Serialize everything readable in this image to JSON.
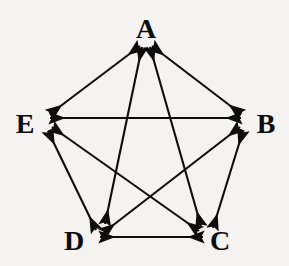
{
  "figure": {
    "background_color": "#f4f3f1",
    "stroke_color": "#0d0d0d",
    "label_color": "#0d0d0d",
    "width": 289,
    "height": 266
  },
  "chart_data": {
    "type": "diagram",
    "subtype": "node-link-graph",
    "title": "",
    "xlabel": "",
    "ylabel": "",
    "grid": false,
    "legend": null,
    "directed": true,
    "bidirectional": true,
    "node_count": 5,
    "edge_count": 10,
    "nodes": [
      {
        "id": "A",
        "label": "A",
        "label_x": 146,
        "label_y": 29,
        "port_x": 146,
        "port_y": 45
      },
      {
        "id": "B",
        "label": "B",
        "label_x": 266,
        "label_y": 124,
        "port_x": 243,
        "port_y": 122
      },
      {
        "id": "C",
        "label": "C",
        "label_x": 220,
        "label_y": 241,
        "port_x": 202,
        "port_y": 230
      },
      {
        "id": "D",
        "label": "D",
        "label_x": 74,
        "label_y": 241,
        "port_x": 100,
        "port_y": 230
      },
      {
        "id": "E",
        "label": "E",
        "label_x": 25,
        "label_y": 124,
        "port_x": 48,
        "port_y": 122
      }
    ],
    "edges": [
      {
        "from": "A",
        "to": "B",
        "kind": "pentagon-side",
        "arrows": "both"
      },
      {
        "from": "B",
        "to": "C",
        "kind": "pentagon-side",
        "arrows": "both"
      },
      {
        "from": "C",
        "to": "D",
        "kind": "pentagon-side",
        "arrows": "both"
      },
      {
        "from": "D",
        "to": "E",
        "kind": "pentagon-side",
        "arrows": "both"
      },
      {
        "from": "E",
        "to": "A",
        "kind": "pentagon-side",
        "arrows": "both"
      },
      {
        "from": "A",
        "to": "C",
        "kind": "pentagram-diagonal",
        "arrows": "both"
      },
      {
        "from": "A",
        "to": "D",
        "kind": "pentagram-diagonal",
        "arrows": "both"
      },
      {
        "from": "B",
        "to": "D",
        "kind": "pentagram-diagonal",
        "arrows": "both"
      },
      {
        "from": "B",
        "to": "E",
        "kind": "pentagram-diagonal",
        "arrows": "both"
      },
      {
        "from": "C",
        "to": "E",
        "kind": "pentagram-diagonal",
        "arrows": "both"
      }
    ],
    "edge_geometry": [
      {
        "id": "A-B",
        "x1": 152,
        "y1": 46,
        "x2": 241,
        "y2": 114
      },
      {
        "id": "A-E",
        "x1": 140,
        "y1": 46,
        "x2": 50,
        "y2": 114
      },
      {
        "id": "E-B",
        "x1": 50,
        "y1": 118,
        "x2": 241,
        "y2": 118
      },
      {
        "id": "E-D",
        "x1": 48,
        "y1": 131,
        "x2": 96,
        "y2": 230
      },
      {
        "id": "B-C",
        "x1": 243,
        "y1": 131,
        "x2": 213,
        "y2": 228
      },
      {
        "id": "D-C",
        "x1": 100,
        "y1": 237,
        "x2": 203,
        "y2": 237
      },
      {
        "id": "A-C",
        "x1": 150,
        "y1": 47,
        "x2": 201,
        "y2": 226
      },
      {
        "id": "A-D",
        "x1": 142,
        "y1": 47,
        "x2": 105,
        "y2": 224
      },
      {
        "id": "E-C",
        "x1": 52,
        "y1": 127,
        "x2": 199,
        "y2": 231
      },
      {
        "id": "B-D",
        "x1": 240,
        "y1": 127,
        "x2": 103,
        "y2": 233
      }
    ]
  }
}
